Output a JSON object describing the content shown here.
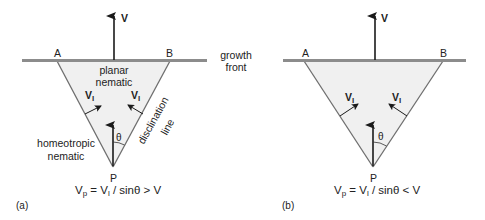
{
  "panels": [
    {
      "id": "a",
      "caption": "(a)",
      "velocity_label": "V",
      "corner_left": "A",
      "corner_right": "B",
      "apex": "P",
      "interior_label_line1": "planar",
      "interior_label_line2": "nematic",
      "exterior_label_line1": "homeotropic",
      "exterior_label_line2": "nematic",
      "edge_label_line1": "disclination",
      "edge_label_line2": "line",
      "side_velocity_left": "V",
      "side_velocity_left_sub": "l",
      "side_velocity_right": "V",
      "side_velocity_right_sub": "l",
      "angle_label": "θ",
      "equation": {
        "lhs": "V",
        "lhs_sub": "p",
        "mid": " = V",
        "mid_sub": "l",
        "rhs": " / sinθ > V"
      }
    },
    {
      "id": "b",
      "caption": "(b)",
      "velocity_label": "V",
      "corner_left": "A",
      "corner_right": "B",
      "apex": "P",
      "side_velocity_left": "V",
      "side_velocity_left_sub": "l",
      "side_velocity_right": "V",
      "side_velocity_right_sub": "l",
      "angle_label": "θ",
      "equation": {
        "lhs": "V",
        "lhs_sub": "p",
        "mid": " = V",
        "mid_sub": "l",
        "rhs": " / sinθ < V"
      }
    }
  ],
  "growth_front_label_line1": "growth",
  "growth_front_label_line2": "front",
  "colors": {
    "front_line": "#8c8c8c",
    "triangle_fill": "#f0f0f0",
    "edge": "#6e6e6e",
    "arrow": "#1a1a1a"
  }
}
